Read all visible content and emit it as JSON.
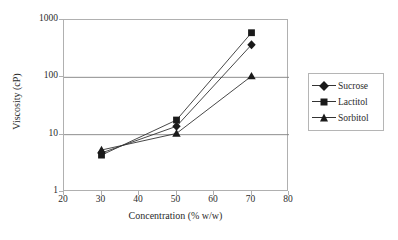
{
  "chart_data": {
    "type": "line",
    "title": "",
    "xlabel": "Concentration (% w/w)",
    "ylabel": "Viscosity (cP)",
    "xlim": [
      20,
      80
    ],
    "ylim": [
      1,
      1000
    ],
    "yscale": "log",
    "xscale": "linear",
    "xticks": [
      20,
      30,
      40,
      50,
      60,
      70,
      80
    ],
    "yticks": [
      1,
      10,
      100,
      1000
    ],
    "xtick_labels": [
      "20",
      "30",
      "40",
      "50",
      "60",
      "70",
      "80"
    ],
    "ytick_labels": [
      "1",
      "10",
      "100",
      "1000"
    ],
    "grid": "horizontal",
    "legend_position": "right-outside",
    "x": [
      30,
      50,
      70
    ],
    "series": [
      {
        "name": "Sucrose",
        "marker": "diamond",
        "values": [
          4.8,
          14,
          370
        ]
      },
      {
        "name": "Lactitol",
        "marker": "square",
        "values": [
          4.4,
          18,
          600
        ]
      },
      {
        "name": "Sorbitol",
        "marker": "triangle",
        "values": [
          5.4,
          10.5,
          105
        ]
      }
    ]
  },
  "legend": {
    "items": [
      {
        "label": "Sucrose",
        "marker": "diamond"
      },
      {
        "label": "Lactitol",
        "marker": "square"
      },
      {
        "label": "Sorbitol",
        "marker": "triangle"
      }
    ]
  },
  "colors": {
    "line": "#333333",
    "marker": "#1a1a1a",
    "grid": "#808080",
    "frame": "#b0b0b0",
    "text": "#2b2b2b",
    "background": "#ffffff"
  }
}
